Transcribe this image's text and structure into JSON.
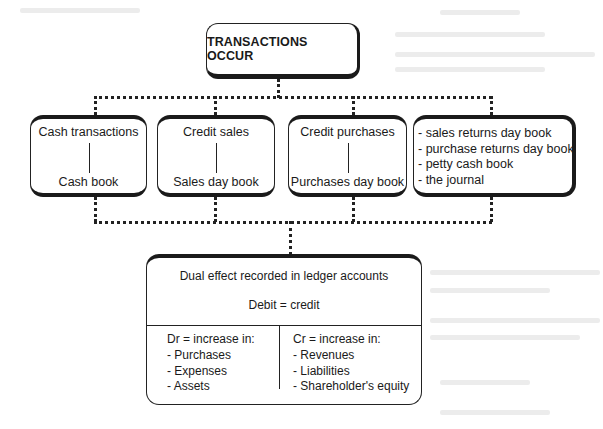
{
  "diagram": {
    "root": {
      "label": "TRANSACTIONS OCCUR"
    },
    "sources": [
      {
        "transaction": "Cash transactions",
        "book": "Cash book"
      },
      {
        "transaction": "Credit sales",
        "book": "Sales day book"
      },
      {
        "transaction": "Credit purchases",
        "book": "Purchases day book"
      }
    ],
    "other_books": [
      "- sales returns day book",
      "- purchase returns day book",
      "- petty cash book",
      "- the journal"
    ],
    "ledger": {
      "title": "Dual effect recorded in ledger accounts",
      "equation": "Debit = credit",
      "debit": {
        "heading": "Dr = increase in:",
        "items": [
          "- Purchases",
          "- Expenses",
          "- Assets"
        ]
      },
      "credit": {
        "heading": "Cr = increase in:",
        "items": [
          "- Revenues",
          "- Liabilities",
          "- Shareholder's equity"
        ]
      }
    }
  }
}
